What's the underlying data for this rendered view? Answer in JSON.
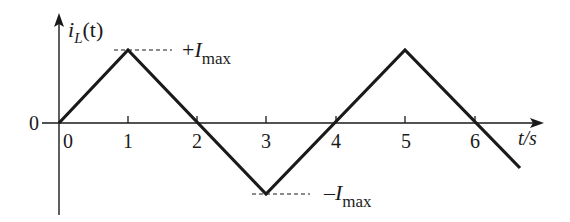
{
  "diagram": {
    "type": "triangular-waveform",
    "y_axis_label": {
      "main": "i",
      "sub": "L",
      "arg": "(t)"
    },
    "x_axis_label": "t/s",
    "origin_label": "0",
    "x_ticks": [
      "0",
      "1",
      "2",
      "3",
      "4",
      "5",
      "6"
    ],
    "annotations": {
      "max": {
        "sign": "+",
        "symbol": "I",
        "sub": "max"
      },
      "min": {
        "sign": "–",
        "symbol": "I",
        "sub": "max"
      }
    },
    "waveform_points": [
      [
        0,
        0
      ],
      [
        1,
        1
      ],
      [
        3,
        -1
      ],
      [
        5,
        1
      ],
      [
        6.65,
        -0.65
      ]
    ],
    "line_color": "#1a1a1a"
  }
}
